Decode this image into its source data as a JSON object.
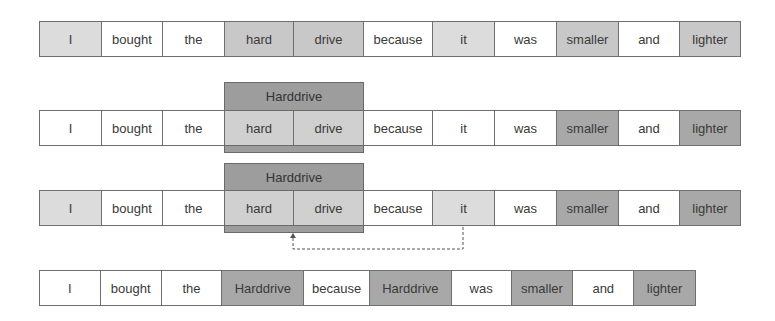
{
  "diagram": {
    "rows": [
      {
        "id": "original",
        "tokens": [
          {
            "text": "I",
            "shade": "light"
          },
          {
            "text": "bought",
            "shade": "white"
          },
          {
            "text": "the",
            "shade": "white"
          },
          {
            "text": "hard",
            "shade": "medium"
          },
          {
            "text": "drive",
            "shade": "medium"
          },
          {
            "text": "because",
            "shade": "white"
          },
          {
            "text": "it",
            "shade": "light"
          },
          {
            "text": "was",
            "shade": "white"
          },
          {
            "text": "smaller",
            "shade": "medium"
          },
          {
            "text": "and",
            "shade": "white"
          },
          {
            "text": "lighter",
            "shade": "medium"
          }
        ]
      },
      {
        "id": "merged-compound",
        "group_label": "Harddrive",
        "tokens": [
          {
            "text": "I",
            "shade": "white"
          },
          {
            "text": "bought",
            "shade": "white"
          },
          {
            "text": "the",
            "shade": "white"
          },
          {
            "text": "hard",
            "shade": "medium"
          },
          {
            "text": "drive",
            "shade": "medium"
          },
          {
            "text": "because",
            "shade": "white"
          },
          {
            "text": "it",
            "shade": "white"
          },
          {
            "text": "was",
            "shade": "white"
          },
          {
            "text": "smaller",
            "shade": "dark"
          },
          {
            "text": "and",
            "shade": "white"
          },
          {
            "text": "lighter",
            "shade": "dark"
          }
        ]
      },
      {
        "id": "coreference",
        "group_label": "Harddrive",
        "tokens": [
          {
            "text": "I",
            "shade": "light"
          },
          {
            "text": "bought",
            "shade": "white"
          },
          {
            "text": "the",
            "shade": "white"
          },
          {
            "text": "hard",
            "shade": "medium"
          },
          {
            "text": "drive",
            "shade": "medium"
          },
          {
            "text": "because",
            "shade": "white"
          },
          {
            "text": "it",
            "shade": "light"
          },
          {
            "text": "was",
            "shade": "white"
          },
          {
            "text": "smaller",
            "shade": "dark"
          },
          {
            "text": "and",
            "shade": "white"
          },
          {
            "text": "lighter",
            "shade": "dark"
          }
        ]
      },
      {
        "id": "resolved",
        "tokens": [
          {
            "text": "I",
            "shade": "white"
          },
          {
            "text": "bought",
            "shade": "white"
          },
          {
            "text": "the",
            "shade": "white"
          },
          {
            "text": "Harddrive",
            "shade": "dark"
          },
          {
            "text": "because",
            "shade": "white"
          },
          {
            "text": "Harddrive",
            "shade": "dark"
          },
          {
            "text": "was",
            "shade": "white"
          },
          {
            "text": "smaller",
            "shade": "dark"
          },
          {
            "text": "and",
            "shade": "white"
          },
          {
            "text": "lighter",
            "shade": "dark"
          }
        ]
      }
    ],
    "link": {
      "from": "it",
      "to": "Harddrive",
      "style": "dashed"
    }
  }
}
